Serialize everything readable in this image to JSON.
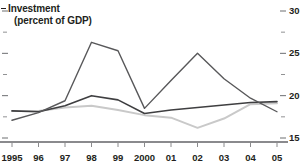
{
  "title": {
    "line1": "Investment",
    "line2": "(percent of GDP)"
  },
  "axis": {
    "y_major_labels": [
      "30",
      "25",
      "20",
      "15"
    ],
    "x_labels": [
      "1995",
      "96",
      "97",
      "98",
      "99",
      "2000",
      "01",
      "02",
      "03",
      "04",
      "05"
    ]
  },
  "colors": {
    "series_dark": "#58585a",
    "series_medium": "#3f3f41",
    "series_light": "#c9c9c9",
    "axis": "#6d6e71",
    "text": "#231f20"
  },
  "chart_data": {
    "type": "line",
    "title": "Investment (percent of GDP)",
    "xlabel": "",
    "ylabel": "percent of GDP",
    "x": [
      "1995",
      "96",
      "97",
      "98",
      "99",
      "2000",
      "01",
      "02",
      "03",
      "04",
      "05"
    ],
    "ylim": [
      15,
      30
    ],
    "yticks_major": [
      15,
      20,
      25,
      30
    ],
    "yticks_minor": [
      17.5,
      22.5,
      27.5
    ],
    "grid": false,
    "legend": "none",
    "axis_position": "right",
    "series": [
      {
        "name": "series-dark",
        "values": [
          17.1,
          18.0,
          19.4,
          26.3,
          25.3,
          18.5,
          21.8,
          25.0,
          22.0,
          19.7,
          18.1
        ]
      },
      {
        "name": "series-medium",
        "values": [
          18.2,
          18.1,
          18.8,
          20.0,
          19.5,
          17.9,
          18.3,
          18.6,
          18.9,
          19.2,
          19.3
        ]
      },
      {
        "name": "series-light",
        "values": [
          18.2,
          18.2,
          18.6,
          18.8,
          18.3,
          17.7,
          17.4,
          16.2,
          17.3,
          19.0,
          19.1
        ]
      }
    ]
  }
}
